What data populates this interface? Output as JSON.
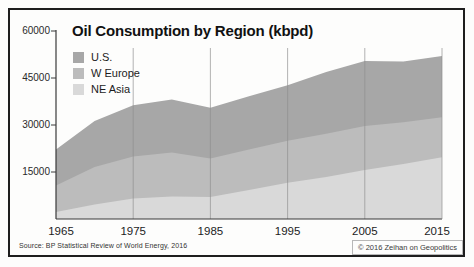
{
  "page": {
    "background": "#fdfdfc",
    "border_color": "#1e1e1e"
  },
  "header": {
    "title": "Oil Consumption by Region (kbpd)"
  },
  "legend": {
    "position": "top-left",
    "items": [
      {
        "label": "U.S.",
        "color": "#a7a7a7"
      },
      {
        "label": "W Europe",
        "color": "#bcbcbc"
      },
      {
        "label": "NE Asia",
        "color": "#d9d9d9"
      }
    ]
  },
  "footer": {
    "source": "Source: BP Statistical Review of World Energy, 2016",
    "copyright": "© 2016 Zeihan on Geopolitics"
  },
  "chart_data": {
    "type": "area",
    "stacked": true,
    "title": "Oil Consumption by Region (kbpd)",
    "xlabel": "",
    "ylabel": "",
    "xlim": [
      1965,
      2015
    ],
    "ylim": [
      0,
      60000
    ],
    "grid": "vertical-only",
    "legend_position": "top-left",
    "x": [
      1965,
      1970,
      1975,
      1980,
      1985,
      1990,
      1995,
      2000,
      2005,
      2010,
      2015
    ],
    "series": [
      {
        "name": "NE Asia",
        "color": "#d9d9d9",
        "values": [
          2200,
          4600,
          6500,
          7200,
          7000,
          9300,
          11600,
          13400,
          15600,
          17600,
          19700
        ]
      },
      {
        "name": "W Europe",
        "color": "#bcbcbc",
        "values": [
          8500,
          12000,
          13400,
          14000,
          12300,
          12900,
          13400,
          13800,
          14100,
          13300,
          12800
        ]
      },
      {
        "name": "U.S.",
        "color": "#a7a7a7",
        "values": [
          11500,
          14700,
          16400,
          16900,
          16200,
          17000,
          17700,
          19700,
          20700,
          19400,
          19500
        ]
      }
    ],
    "stacking_order_bottom_to_top": [
      "NE Asia",
      "W Europe",
      "U.S."
    ],
    "y_ticks": [
      15000,
      30000,
      45000,
      60000
    ],
    "x_ticks": [
      1965,
      1975,
      1985,
      1995,
      2005,
      2015
    ],
    "axis_color": "#3a3a3a",
    "gridline_color": "#8f8f8f"
  }
}
